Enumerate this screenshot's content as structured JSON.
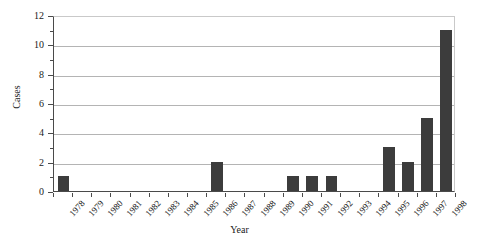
{
  "chart_data": {
    "type": "bar",
    "title": "",
    "xlabel": "Year",
    "ylabel": "Cases",
    "categories": [
      "1978",
      "1979",
      "1980",
      "1981",
      "1982",
      "1983",
      "1984",
      "1985",
      "1986",
      "1987",
      "1988",
      "1989",
      "1990",
      "1991",
      "1992",
      "1993",
      "1994",
      "1995",
      "1996",
      "1997",
      "1998"
    ],
    "values": [
      1,
      0,
      0,
      0,
      0,
      0,
      0,
      0,
      2,
      0,
      0,
      0,
      1,
      1,
      1,
      0,
      0,
      3,
      2,
      5,
      11
    ],
    "ylim": [
      0,
      12
    ],
    "ytick_labels": [
      "0",
      "2",
      "4",
      "6",
      "8",
      "10",
      "12"
    ],
    "ytick_values": [
      0,
      2,
      4,
      6,
      8,
      10,
      12
    ],
    "yminor_values": [
      1,
      3,
      5,
      7,
      9,
      11
    ],
    "grid": "horizontal",
    "legend": "none",
    "bar_color": "#3c3c3c",
    "grid_color": "#b4b4b4",
    "axis_color": "#4a4a4a",
    "background_color": "#ffffff"
  }
}
